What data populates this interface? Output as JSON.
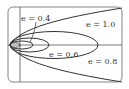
{
  "figure": {
    "type": "conic-family",
    "axes": {
      "horizontal": true,
      "vertical": true
    },
    "curves": [
      {
        "eccentricity": 0.2,
        "kind": "ellipse"
      },
      {
        "eccentricity": 0.4,
        "kind": "ellipse"
      },
      {
        "eccentricity": 0.6,
        "kind": "ellipse"
      },
      {
        "eccentricity": 0.8,
        "kind": "ellipse"
      },
      {
        "eccentricity": 1.0,
        "kind": "parabola"
      }
    ],
    "labels": {
      "e04": "e = 0.4",
      "e10": "e = 1.0",
      "e06": "e = 0.6",
      "e08": "e = 0.8"
    },
    "colors": {
      "stroke": "#333333",
      "frame": "#666666",
      "background": "#ffffff"
    }
  }
}
